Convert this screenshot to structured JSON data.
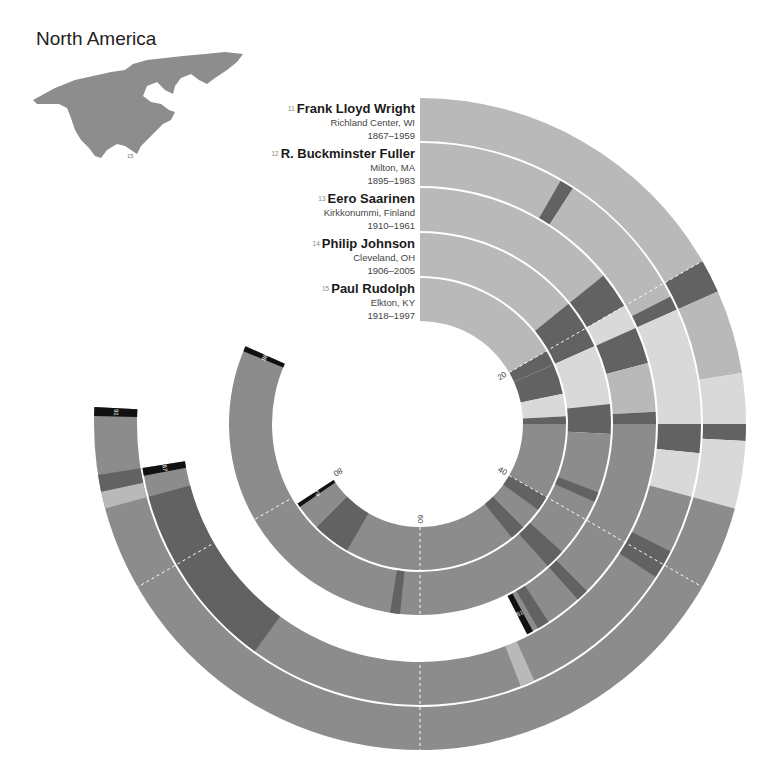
{
  "region": {
    "title": "North America",
    "map_marker": "15"
  },
  "chart_data": {
    "type": "radial-timeline",
    "title": "North America",
    "axis": {
      "unit": "age (years)",
      "start_angle_deg": 0,
      "deg_per_year": 3,
      "tick_labels": [
        "20",
        "40",
        "60",
        "80"
      ],
      "tick_values": [
        20,
        40,
        60,
        80
      ]
    },
    "colors": {
      "early": "#b9b9b9",
      "career": "#8c8c8c",
      "dark": "#626262",
      "light": "#d9d9d9",
      "marker": "#111111"
    },
    "series": [
      {
        "id": 11,
        "name": "Frank Lloyd Wright",
        "birthplace": "Richland Center, WI",
        "years": "1867–1959",
        "age_at_death": 91,
        "segments": [
          [
            0,
            20,
            "early"
          ],
          [
            20,
            22,
            "dark"
          ],
          [
            22,
            27,
            "early"
          ],
          [
            27,
            30,
            "light"
          ],
          [
            30,
            31,
            "dark"
          ],
          [
            31,
            35,
            "light"
          ],
          [
            35,
            91,
            "career"
          ],
          [
            85,
            86,
            "early"
          ],
          [
            86,
            87,
            "dark"
          ]
        ]
      },
      {
        "id": 12,
        "name": "R. Buckminster Fuller",
        "birthplace": "Milton, MA",
        "years": "1895–1983",
        "age_at_death": 87,
        "segments": [
          [
            0,
            10,
            "early"
          ],
          [
            10,
            11,
            "dark"
          ],
          [
            11,
            21,
            "early"
          ],
          [
            21,
            22,
            "dark"
          ],
          [
            22,
            30,
            "light"
          ],
          [
            30,
            32,
            "dark"
          ],
          [
            32,
            35,
            "light"
          ],
          [
            35,
            87,
            "career"
          ],
          [
            39,
            41,
            "dark"
          ],
          [
            52,
            53,
            "early"
          ],
          [
            72,
            85,
            "dark"
          ]
        ]
      },
      {
        "id": 13,
        "name": "Eero Saarinen",
        "birthplace": "Kirkkonummi, Finland",
        "years": "1910–1961",
        "age_at_death": 51,
        "segments": [
          [
            0,
            17,
            "early"
          ],
          [
            17,
            20,
            "dark"
          ],
          [
            20,
            22,
            "light"
          ],
          [
            22,
            25,
            "dark"
          ],
          [
            25,
            29,
            "early"
          ],
          [
            29,
            30,
            "dark"
          ],
          [
            30,
            51,
            "career"
          ],
          [
            45,
            46,
            "dark"
          ],
          [
            49,
            50,
            "dark"
          ]
        ]
      },
      {
        "id": 14,
        "name": "Philip Johnson",
        "birthplace": "Cleveland, OH",
        "years": "1906–2005",
        "age_at_death": 98,
        "segments": [
          [
            0,
            17,
            "early"
          ],
          [
            17,
            22,
            "dark"
          ],
          [
            22,
            28,
            "light"
          ],
          [
            28,
            31,
            "dark"
          ],
          [
            31,
            98,
            "career"
          ],
          [
            37,
            38,
            "dark"
          ],
          [
            44,
            46,
            "dark"
          ],
          [
            62,
            63,
            "dark"
          ]
        ]
      },
      {
        "id": 15,
        "name": "Paul Rudolph",
        "birthplace": "Elkton, KY",
        "years": "1918–1997",
        "age_at_death": 79,
        "segments": [
          [
            0,
            20,
            "early"
          ],
          [
            20,
            22,
            "dark"
          ],
          [
            22,
            26,
            "dark"
          ],
          [
            26,
            29,
            "light"
          ],
          [
            29,
            30,
            "dark"
          ],
          [
            30,
            79,
            "career"
          ],
          [
            40,
            42,
            "dark"
          ],
          [
            45,
            47,
            "dark"
          ],
          [
            70,
            75,
            "dark"
          ]
        ]
      }
    ]
  }
}
